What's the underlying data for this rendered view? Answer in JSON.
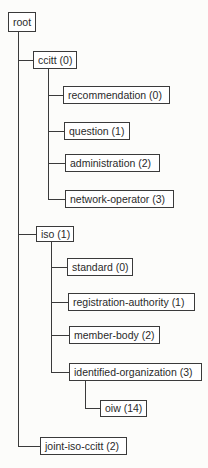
{
  "diagram": {
    "type": "tree",
    "root": {
      "label": "root",
      "children": [
        {
          "label": "ccitt (0)",
          "children": [
            {
              "label": "recommendation (0)"
            },
            {
              "label": "question (1)"
            },
            {
              "label": "administration (2)"
            },
            {
              "label": "network-operator (3)"
            }
          ]
        },
        {
          "label": "iso (1)",
          "children": [
            {
              "label": "standard (0)"
            },
            {
              "label": "registration-authority (1)"
            },
            {
              "label": "member-body (2)"
            },
            {
              "label": "identified-organization (3)",
              "children": [
                {
                  "label": "oiw (14)"
                }
              ]
            }
          ]
        },
        {
          "label": "joint-iso-ccitt (2)"
        }
      ]
    }
  },
  "nodes": {
    "root": "root",
    "ccitt": "ccitt (0)",
    "recommendation": "recommendation (0)",
    "question": "question (1)",
    "administration": "administration (2)",
    "network_operator": "network-operator (3)",
    "iso": "iso (1)",
    "standard": "standard (0)",
    "registration_authority": "registration-authority (1)",
    "member_body": "member-body (2)",
    "identified_organization": "identified-organization (3)",
    "oiw": "oiw (14)",
    "joint_iso_ccitt": "joint-iso-ccitt (2)"
  }
}
